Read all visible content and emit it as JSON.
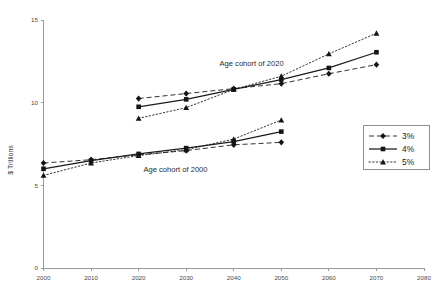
{
  "chart_data": {
    "type": "line",
    "title": "",
    "xlabel": "",
    "ylabel": "$ Trillions",
    "xlim": [
      2000,
      2080
    ],
    "ylim": [
      0,
      15
    ],
    "xticks": [
      2000,
      2010,
      2020,
      2030,
      2040,
      2050,
      2060,
      2070,
      2080
    ],
    "yticks": [
      0,
      5,
      10,
      15
    ],
    "grid": false,
    "legend_position": "right",
    "legend_entries": [
      "3%",
      "4%",
      "5%"
    ],
    "annotations": [
      {
        "text": "Age cohort of 2020",
        "x": 2037,
        "y": 12.2
      },
      {
        "text": "Age cohort of 2000",
        "x": 2021,
        "y": 5.8
      }
    ],
    "groups": [
      {
        "name": "Age cohort of 2000",
        "x": [
          2000,
          2010,
          2020,
          2030,
          2040,
          2050
        ],
        "series": [
          {
            "name": "3%",
            "marker": "diamond",
            "style": "dashed",
            "values": [
              6.35,
              6.55,
              6.85,
              7.1,
              7.45,
              7.6
            ]
          },
          {
            "name": "4%",
            "marker": "square",
            "style": "solid",
            "values": [
              6.0,
              6.5,
              6.9,
              7.25,
              7.65,
              8.25
            ]
          },
          {
            "name": "5%",
            "marker": "triangle",
            "style": "dotted",
            "values": [
              5.6,
              6.35,
              6.8,
              7.15,
              7.8,
              8.95
            ]
          }
        ]
      },
      {
        "name": "Age cohort of 2020",
        "x": [
          2020,
          2030,
          2040,
          2050,
          2060,
          2070
        ],
        "series": [
          {
            "name": "3%",
            "marker": "diamond",
            "style": "dashed",
            "values": [
              10.25,
              10.55,
              10.85,
              11.15,
              11.75,
              12.3
            ]
          },
          {
            "name": "4%",
            "marker": "square",
            "style": "solid",
            "values": [
              9.75,
              10.2,
              10.8,
              11.4,
              12.1,
              13.05
            ]
          },
          {
            "name": "5%",
            "marker": "triangle",
            "style": "dotted",
            "values": [
              9.05,
              9.7,
              10.8,
              11.6,
              12.95,
              14.2
            ]
          }
        ]
      }
    ]
  },
  "axes": {
    "y_axis_title": "$ Trillions",
    "y_tick_labels": [
      "15",
      "10",
      "5",
      "0"
    ],
    "x_tick_labels": [
      "2000",
      "2010",
      "2020",
      "2030",
      "2040",
      "2050",
      "2060",
      "2070",
      "2080"
    ]
  },
  "annotations": {
    "cohort_2020": "Age cohort of 2020",
    "cohort_2000": "Age cohort of 2000"
  },
  "legend": {
    "items": [
      {
        "label": "3%",
        "marker": "diamond",
        "style": "dashed"
      },
      {
        "label": "4%",
        "marker": "square",
        "style": "solid"
      },
      {
        "label": "5%",
        "marker": "triangle",
        "style": "dotted"
      }
    ]
  },
  "colors": {
    "series": "#1b1b1b",
    "axis": "#9a9a9a",
    "text": "#2b2b2b",
    "background": "#ffffff"
  }
}
